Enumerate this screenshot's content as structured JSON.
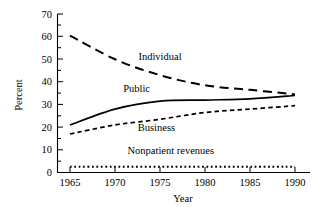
{
  "chart_data": {
    "type": "line",
    "title": "",
    "xlabel": "Year",
    "ylabel": "Percent",
    "xlim": [
      1965,
      1990
    ],
    "ylim": [
      0,
      70
    ],
    "grid": false,
    "legend": "inline-labels",
    "x": [
      1965,
      1970,
      1975,
      1980,
      1985,
      1990
    ],
    "xticks": [
      "1965",
      "1970",
      "1975",
      "1980",
      "1985",
      "1990"
    ],
    "yticks": [
      "0",
      "10",
      "20",
      "30",
      "40",
      "50",
      "60",
      "70"
    ],
    "ytick_minor_step": 5,
    "series": [
      {
        "name": "Individual",
        "style": "long-dashed",
        "values": [
          60.5,
          50.0,
          43.0,
          38.5,
          36.5,
          34.5
        ]
      },
      {
        "name": "Public",
        "style": "solid",
        "values": [
          21.0,
          28.0,
          31.5,
          32.0,
          32.5,
          34.0
        ]
      },
      {
        "name": "Business",
        "style": "short-dashed",
        "values": [
          17.0,
          21.0,
          23.5,
          26.5,
          28.0,
          29.5
        ]
      },
      {
        "name": "Nonpatient revenues",
        "style": "dotted",
        "values": [
          2.5,
          2.5,
          2.5,
          2.5,
          2.5,
          2.5
        ]
      }
    ],
    "annotations": [
      {
        "text": "Individual",
        "x": 1975.0,
        "y": 49.5
      },
      {
        "text": "Public",
        "x": 1972.4,
        "y": 35.5
      },
      {
        "text": "Business",
        "x": 1974.6,
        "y": 18.3
      },
      {
        "text": "Nonpatient revenues",
        "x": 1976.2,
        "y": 8.2
      }
    ]
  }
}
